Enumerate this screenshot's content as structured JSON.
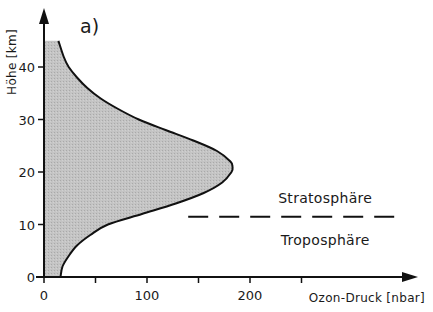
{
  "chart_data": {
    "type": "area",
    "panel_label": "a)",
    "title": "",
    "xlabel": "Ozon-Druck [nbar]",
    "ylabel": "Höhe [km]",
    "xlim": [
      0,
      300
    ],
    "ylim": [
      0,
      45
    ],
    "x_ticks": [
      0,
      50,
      100,
      150,
      200,
      250
    ],
    "x_tick_labels": [
      "0",
      "",
      "100",
      "",
      "200",
      ""
    ],
    "y_ticks": [
      0,
      10,
      20,
      30,
      40
    ],
    "y_tick_labels": [
      "0",
      "10",
      "20",
      "30",
      "40"
    ],
    "grid": false,
    "legend": null,
    "series": [
      {
        "name": "Ozone partial pressure",
        "fill": "#bdbdbd",
        "line": "#111111",
        "points": [
          {
            "altitude_km": 0,
            "ozone_nbar": 16
          },
          {
            "altitude_km": 2,
            "ozone_nbar": 18
          },
          {
            "altitude_km": 4,
            "ozone_nbar": 24
          },
          {
            "altitude_km": 6,
            "ozone_nbar": 32
          },
          {
            "altitude_km": 8,
            "ozone_nbar": 45
          },
          {
            "altitude_km": 10,
            "ozone_nbar": 62
          },
          {
            "altitude_km": 12,
            "ozone_nbar": 95
          },
          {
            "altitude_km": 14,
            "ozone_nbar": 128
          },
          {
            "altitude_km": 16,
            "ozone_nbar": 155
          },
          {
            "altitude_km": 18,
            "ozone_nbar": 173
          },
          {
            "altitude_km": 20,
            "ozone_nbar": 182
          },
          {
            "altitude_km": 21,
            "ozone_nbar": 183
          },
          {
            "altitude_km": 22,
            "ozone_nbar": 181
          },
          {
            "altitude_km": 24,
            "ozone_nbar": 168
          },
          {
            "altitude_km": 26,
            "ozone_nbar": 145
          },
          {
            "altitude_km": 28,
            "ozone_nbar": 118
          },
          {
            "altitude_km": 30,
            "ozone_nbar": 92
          },
          {
            "altitude_km": 32,
            "ozone_nbar": 72
          },
          {
            "altitude_km": 34,
            "ozone_nbar": 55
          },
          {
            "altitude_km": 36,
            "ozone_nbar": 42
          },
          {
            "altitude_km": 38,
            "ozone_nbar": 32
          },
          {
            "altitude_km": 40,
            "ozone_nbar": 24
          },
          {
            "altitude_km": 42,
            "ozone_nbar": 19
          },
          {
            "altitude_km": 45,
            "ozone_nbar": 14
          }
        ]
      }
    ],
    "annotations": [
      {
        "text": "Stratosphäre",
        "x_nbar": 273,
        "altitude_km": 15
      },
      {
        "text": "Troposphäre",
        "x_nbar": 273,
        "altitude_km": 7
      },
      {
        "type": "dashed_line",
        "label": "Tropopause",
        "altitude_km": 11.5,
        "x_from_nbar": 140,
        "x_to_nbar": 343
      }
    ]
  }
}
